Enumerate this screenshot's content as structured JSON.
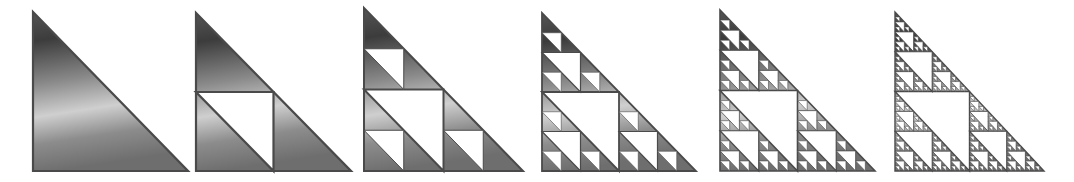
{
  "figure": {
    "background": "#ffffff",
    "fill_gradient": {
      "stops": [
        {
          "offset": 0.0,
          "color": "#555555"
        },
        {
          "offset": 0.18,
          "color": "#3c3c3c"
        },
        {
          "offset": 0.45,
          "color": "#8a8a8a"
        },
        {
          "offset": 0.65,
          "color": "#cfcfcf"
        },
        {
          "offset": 0.82,
          "color": "#8c8c8c"
        },
        {
          "offset": 1.0,
          "color": "#6e6e6e"
        }
      ]
    },
    "stroke_color": "#4a4a4a",
    "hole_color": "#ffffff",
    "panels": [
      {
        "iteration": 0,
        "x": 33,
        "y": 12,
        "w": 155,
        "h": 159,
        "stroke": 2.2
      },
      {
        "iteration": 1,
        "x": 196,
        "y": 13,
        "w": 155,
        "h": 158,
        "stroke": 2.2
      },
      {
        "iteration": 2,
        "x": 364,
        "y": 8,
        "w": 159,
        "h": 163,
        "stroke": 2.0
      },
      {
        "iteration": 3,
        "x": 542,
        "y": 13,
        "w": 154,
        "h": 158,
        "stroke": 1.8
      },
      {
        "iteration": 4,
        "x": 720,
        "y": 10,
        "w": 155,
        "h": 161,
        "stroke": 1.6
      },
      {
        "iteration": 5,
        "x": 895,
        "y": 12,
        "w": 149,
        "h": 159,
        "stroke": 1.4
      }
    ]
  }
}
